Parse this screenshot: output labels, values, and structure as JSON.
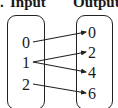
{
  "diagram": {
    "type": "mapping-diagram",
    "headers": {
      "lead": ".",
      "input": "Input",
      "output": "Output"
    },
    "inputs": [
      "0",
      "1",
      "2"
    ],
    "outputs": [
      "0",
      "2",
      "4",
      "6"
    ],
    "mappings": [
      {
        "from": "0",
        "to": "0"
      },
      {
        "from": "1",
        "to": "2"
      },
      {
        "from": "1",
        "to": "4"
      },
      {
        "from": "2",
        "to": "6"
      }
    ],
    "colors": {
      "stroke": "#222222",
      "text": "#1a1a1a",
      "background": "#ffffff"
    }
  }
}
